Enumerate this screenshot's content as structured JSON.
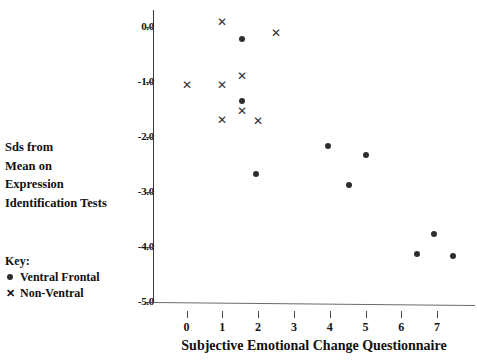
{
  "chart_data": {
    "type": "scatter",
    "title": "",
    "xlabel": "Subjective Emotional Change Questionnaire",
    "ylabel": "Sds from Mean on Expression Identification Tests",
    "ylabel_lines": [
      "Sds from",
      "Mean on",
      "Expression",
      "Identification Tests"
    ],
    "xlim": [
      -0.6,
      8.2
    ],
    "ylim": [
      -5.0,
      0.35
    ],
    "xticks": [
      0,
      1,
      2,
      3,
      4,
      5,
      6,
      7
    ],
    "xticklabels": [
      "0",
      "1",
      "2",
      "3",
      "4",
      "5",
      "6",
      "7"
    ],
    "yticks": [
      0.0,
      -1.0,
      -2.0,
      -3.0,
      -4.0,
      -5.0
    ],
    "yticklabels": [
      "0.0",
      "-1.0",
      "-2.0",
      "-3.0",
      "-4.0",
      "-5.0"
    ],
    "grid": false,
    "legend_position": "outside-left-bottom",
    "legend_title": "Key:",
    "series": [
      {
        "name": "Ventral Frontal",
        "marker": "circle",
        "color": "#2e2e2e",
        "points": [
          {
            "x": 1.55,
            "y": -0.22
          },
          {
            "x": 1.55,
            "y": -1.35
          },
          {
            "x": 1.95,
            "y": -2.67
          },
          {
            "x": 3.95,
            "y": -2.17
          },
          {
            "x": 5.0,
            "y": -2.33
          },
          {
            "x": 4.55,
            "y": -2.88
          },
          {
            "x": 6.9,
            "y": -3.77
          },
          {
            "x": 6.45,
            "y": -4.12
          },
          {
            "x": 7.45,
            "y": -4.17
          }
        ]
      },
      {
        "name": "Non-Ventral",
        "marker": "cross",
        "color": "#2e2e2e",
        "symbol": "✕",
        "points": [
          {
            "x": 1.0,
            "y": 0.08
          },
          {
            "x": 2.5,
            "y": -0.12
          },
          {
            "x": 1.55,
            "y": -0.9
          },
          {
            "x": 0.0,
            "y": -1.07
          },
          {
            "x": 1.0,
            "y": -1.07
          },
          {
            "x": 1.55,
            "y": -1.53
          },
          {
            "x": 1.0,
            "y": -1.7
          },
          {
            "x": 2.0,
            "y": -1.72
          }
        ]
      }
    ]
  },
  "key": {
    "title": "Key:",
    "entries": [
      {
        "symbol": "●",
        "label": "Ventral Frontal"
      },
      {
        "symbol": "✕",
        "label": "Non-Ventral"
      }
    ]
  }
}
